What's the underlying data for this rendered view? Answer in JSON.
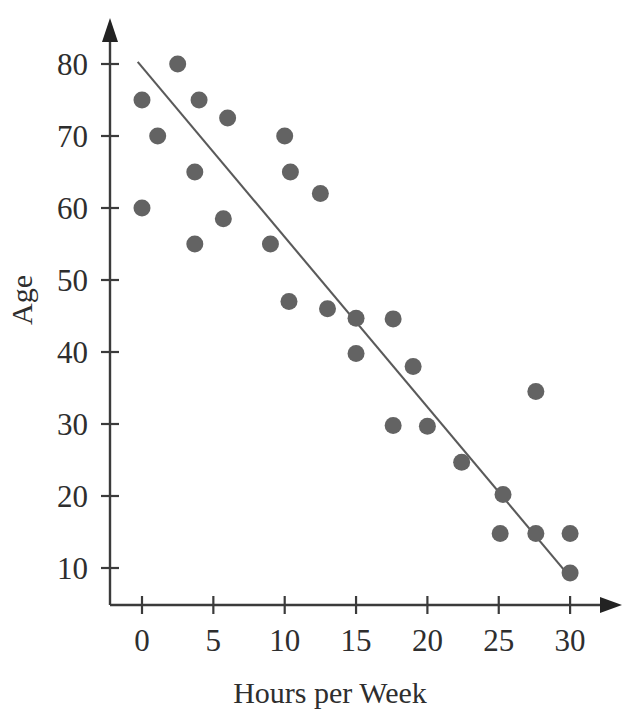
{
  "chart_data": {
    "type": "scatter",
    "title": "",
    "xlabel": "Hours per Week",
    "ylabel": "Age",
    "xlim": [
      -2,
      33
    ],
    "ylim": [
      5,
      85
    ],
    "xticks": [
      0,
      5,
      10,
      15,
      20,
      25,
      30
    ],
    "xtick_labels": [
      "0",
      "5",
      "10",
      "15",
      "20",
      "25",
      "30"
    ],
    "yticks": [
      10,
      20,
      30,
      40,
      50,
      60,
      70,
      80
    ],
    "ytick_labels": [
      "10",
      "20",
      "30",
      "40",
      "50",
      "60",
      "70",
      "80"
    ],
    "grid": false,
    "legend": false,
    "marker_color": "#636363",
    "marker_radius": 8.5,
    "line_color": "#5a5a5a",
    "axis_color": "#3b3b3b",
    "series": [
      {
        "name": "observations",
        "points": [
          [
            0.0,
            75.0
          ],
          [
            0.0,
            60.0
          ],
          [
            1.1,
            70.0
          ],
          [
            2.5,
            80.0
          ],
          [
            3.7,
            65.0
          ],
          [
            3.7,
            55.0
          ],
          [
            4.0,
            75.0
          ],
          [
            5.7,
            58.5
          ],
          [
            6.0,
            72.5
          ],
          [
            9.0,
            55.0
          ],
          [
            10.0,
            70.0
          ],
          [
            10.4,
            65.0
          ],
          [
            10.3,
            47.0
          ],
          [
            12.5,
            62.0
          ],
          [
            13.0,
            46.0
          ],
          [
            15.0,
            44.7
          ],
          [
            15.0,
            39.8
          ],
          [
            17.6,
            44.6
          ],
          [
            17.6,
            29.8
          ],
          [
            19.0,
            38.0
          ],
          [
            20.0,
            29.7
          ],
          [
            22.4,
            24.7
          ],
          [
            25.3,
            20.2
          ],
          [
            25.1,
            14.8
          ],
          [
            27.6,
            34.5
          ],
          [
            27.6,
            14.8
          ],
          [
            30.0,
            14.8
          ],
          [
            30.0,
            9.3
          ]
        ]
      }
    ],
    "trend_line": {
      "name": "regression-line",
      "x0": -0.3,
      "y0": 80.3,
      "x1": 30.1,
      "y1": 8.5
    }
  }
}
